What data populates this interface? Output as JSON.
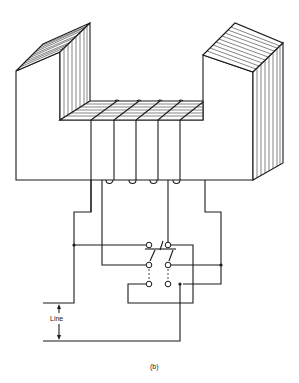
{
  "figure": {
    "caption": "(b)",
    "labels": {
      "line": "Line"
    },
    "components": {
      "core": "U-shaped laminated iron core",
      "winding": "coil with multiple taps on base yoke",
      "switch": "double-pole switch with six terminals",
      "junctions": 3
    }
  }
}
